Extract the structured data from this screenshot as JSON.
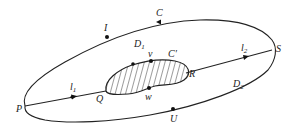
{
  "diagram": {
    "colors": {
      "stroke": "#222222",
      "background": "#ffffff"
    },
    "labels": {
      "I": "I",
      "C": "C",
      "S": "S",
      "P": "P",
      "U": "U",
      "Q": "Q",
      "R": "R",
      "v": "v",
      "w": "w",
      "C_prime": "C′",
      "D1": {
        "base": "D",
        "sub": "1"
      },
      "D2": {
        "base": "D",
        "sub": "2"
      },
      "l1": {
        "base": "l",
        "sub": "1"
      },
      "l2": {
        "base": "l",
        "sub": "2"
      }
    }
  }
}
